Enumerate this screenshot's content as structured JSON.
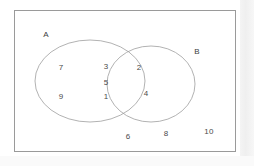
{
  "figure": {
    "type": "venn-diagram",
    "frame_border_color": "#9a9a9a",
    "curve_color": "#9e9e9e",
    "text_color": "#3d3d3d",
    "background": "#ffffff"
  },
  "sets": [
    {
      "name": "set-a",
      "label": "A",
      "x": 45,
      "y": 34
    },
    {
      "name": "set-b",
      "label": "B",
      "x": 196,
      "y": 51
    }
  ],
  "regions": {
    "a_only": {
      "label": "A only",
      "values": [
        "7",
        "9"
      ]
    },
    "intersection": {
      "label": "A and B",
      "values": [
        "3",
        "5",
        "1"
      ]
    },
    "b_only": {
      "label": "B only",
      "values": [
        "2",
        "4"
      ]
    },
    "outside": {
      "label": "Outside both sets",
      "values": [
        "6",
        "8",
        "10"
      ]
    }
  },
  "elements": [
    {
      "name": "element-7",
      "value": "7",
      "region": "a_only",
      "x": 60,
      "y": 67
    },
    {
      "name": "element-9",
      "value": "9",
      "region": "a_only",
      "x": 60,
      "y": 96
    },
    {
      "name": "element-3",
      "value": "3",
      "region": "intersection",
      "x": 105,
      "y": 66
    },
    {
      "name": "element-5",
      "value": "5",
      "region": "intersection",
      "x": 105,
      "y": 82
    },
    {
      "name": "element-1",
      "value": "1",
      "region": "intersection",
      "x": 105,
      "y": 96
    },
    {
      "name": "element-2",
      "value": "2",
      "region": "b_only",
      "x": 138,
      "y": 67
    },
    {
      "name": "element-4",
      "value": "4",
      "region": "b_only",
      "x": 145,
      "y": 93
    },
    {
      "name": "element-6",
      "value": "6",
      "region": "outside",
      "x": 127,
      "y": 136
    },
    {
      "name": "element-8",
      "value": "8",
      "region": "outside",
      "x": 165,
      "y": 133
    },
    {
      "name": "element-10",
      "value": "10",
      "region": "outside",
      "x": 208,
      "y": 131
    }
  ],
  "geometry": {
    "circle_a": {
      "cx": 89,
      "cy": 80,
      "rx": 55,
      "ry": 41
    },
    "ellipse_b": {
      "cx": 150,
      "cy": 83,
      "rx": 44,
      "ry": 38
    }
  }
}
